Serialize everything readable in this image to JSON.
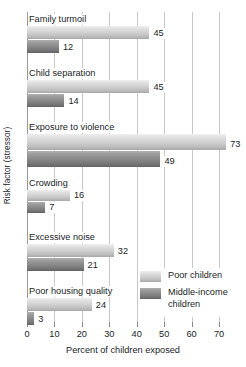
{
  "chart_data": {
    "type": "bar",
    "orientation": "horizontal",
    "title": "",
    "xlabel": "Percent of children exposed",
    "ylabel": "Risk factor (stressor)",
    "xlim": [
      0,
      70
    ],
    "xticks": [
      0,
      10,
      20,
      30,
      40,
      50,
      60,
      70
    ],
    "xtick_labels": [
      "0",
      "10",
      "20",
      "30",
      "40",
      "50",
      "60",
      "70"
    ],
    "grid": "vertical",
    "legend_position": "inside-lower-right",
    "categories": [
      "Family turmoil",
      "Child separation",
      "Exposure to violence",
      "Crowding",
      "Excessive noise",
      "Poor housing quality"
    ],
    "series": [
      {
        "name": "Poor children",
        "color": "#d2d2d2",
        "values": [
          45,
          45,
          73,
          16,
          32,
          24
        ],
        "labels": [
          "45",
          "45",
          "73",
          "16",
          "32",
          "24"
        ]
      },
      {
        "name": "Middle-income children",
        "color": "#8b8b8b",
        "values": [
          12,
          14,
          49,
          7,
          21,
          3
        ],
        "labels": [
          "12",
          "14",
          "49",
          "7",
          "21",
          "3"
        ]
      }
    ]
  },
  "axes": {
    "y_title": "Risk factor (stressor)",
    "x_title": "Percent of children exposed"
  },
  "legend": {
    "items": [
      {
        "label": "Poor children",
        "swatch": "poor"
      },
      {
        "label": "Middle-income children",
        "swatch": "middle"
      }
    ]
  }
}
